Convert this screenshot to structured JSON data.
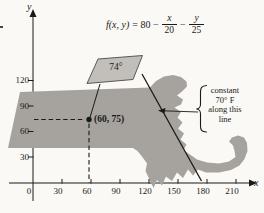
{
  "formula": {
    "fxy": "f(x, y)",
    "eq": "= 80 −",
    "frac1_num": "x",
    "frac1_den": "20",
    "minus": "−",
    "frac2_num": "y",
    "frac2_den": "25"
  },
  "axes": {
    "x_label": "x",
    "y_label": "y",
    "x_ticks": [
      "0",
      "30",
      "60",
      "90",
      "120",
      "150",
      "180",
      "210"
    ],
    "y_ticks": [
      "120",
      "90",
      "60",
      "30"
    ]
  },
  "point": {
    "label": "(60, 75)",
    "x": 60,
    "y": 75
  },
  "temperature_tag": {
    "label": "74°"
  },
  "callout": {
    "line1": "constant",
    "line2": "70° F",
    "line3": "along this",
    "line4": "line"
  },
  "colors": {
    "map_fill": "#a6a29d",
    "tag_fill": "#c2bfba",
    "ink": "#1a1a1a",
    "background": "#fbf9f5"
  }
}
